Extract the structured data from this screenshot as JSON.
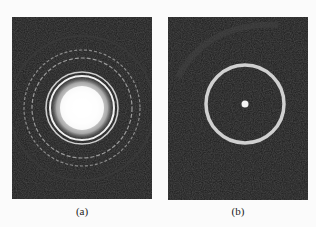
{
  "figure": {
    "panels": [
      {
        "id": "a",
        "caption": "(a)",
        "description": "Electron diffraction pattern with bright central spot and multiple concentric rings"
      },
      {
        "id": "b",
        "caption": "(b)",
        "description": "Electron diffraction pattern with small central spot and single bright ring"
      }
    ],
    "colors": {
      "background": "#fbfbfb",
      "panel": "#1c1c1c",
      "ring": "#d8d8d8"
    }
  }
}
